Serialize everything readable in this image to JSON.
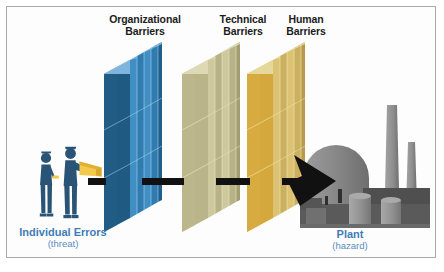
{
  "figure": {
    "background_color": "#fdfdfd",
    "border_color": "#a9a9a9"
  },
  "barriers": [
    {
      "id": "organizational",
      "label": "Organizational\nBarriers",
      "label_x": 145,
      "label_y": 14,
      "front_color": "#1f5a82",
      "front_color_dark": "#174a6d",
      "top_color": "#7fb4dc",
      "side_color": "#3f8fc4",
      "side_color_2": "#2f7cb0",
      "x": 104,
      "panel_count": 4
    },
    {
      "id": "technical",
      "label": "Technical\nBarriers",
      "label_x": 243,
      "label_y": 14,
      "front_color": "#b9b589",
      "front_color_dark": "#a7a378",
      "top_color": "#ded9b4",
      "side_color": "#c9c49a",
      "side_color_2": "#b3ae84",
      "x": 182,
      "panel_count": 4
    },
    {
      "id": "human",
      "label": "Human\nBarriers",
      "label_x": 305,
      "label_y": 14,
      "front_color": "#d4a83c",
      "front_color_dark": "#c39a31",
      "top_color": "#e6d79b",
      "side_color": "#dcc273",
      "side_color_2": "#cbb05e",
      "x": 247,
      "panel_count": 4
    }
  ],
  "threat": {
    "main": "Individual Errors",
    "sub": "(threat)",
    "main_x": 62,
    "main_y": 228,
    "color": "#3f7cb8",
    "figure_color": "#2a5475",
    "accessory_color": "#f2c94c"
  },
  "hazard": {
    "main": "Plant",
    "sub": "(hazard)",
    "main_x": 350,
    "main_y": 230,
    "color": "#3f7cb8",
    "plant_color": "#8c8c8c",
    "plant_color_dark": "#4f4f4f"
  },
  "arrow": {
    "color": "#111111",
    "segments": [
      {
        "x": 88,
        "y": 178,
        "w": 18,
        "h": 7
      },
      {
        "x": 142,
        "y": 178,
        "w": 42,
        "h": 7
      },
      {
        "x": 216,
        "y": 178,
        "w": 34,
        "h": 7
      },
      {
        "x": 282,
        "y": 178,
        "w": 26,
        "h": 7
      }
    ],
    "head_tip_x": 334,
    "head_y": 181
  }
}
